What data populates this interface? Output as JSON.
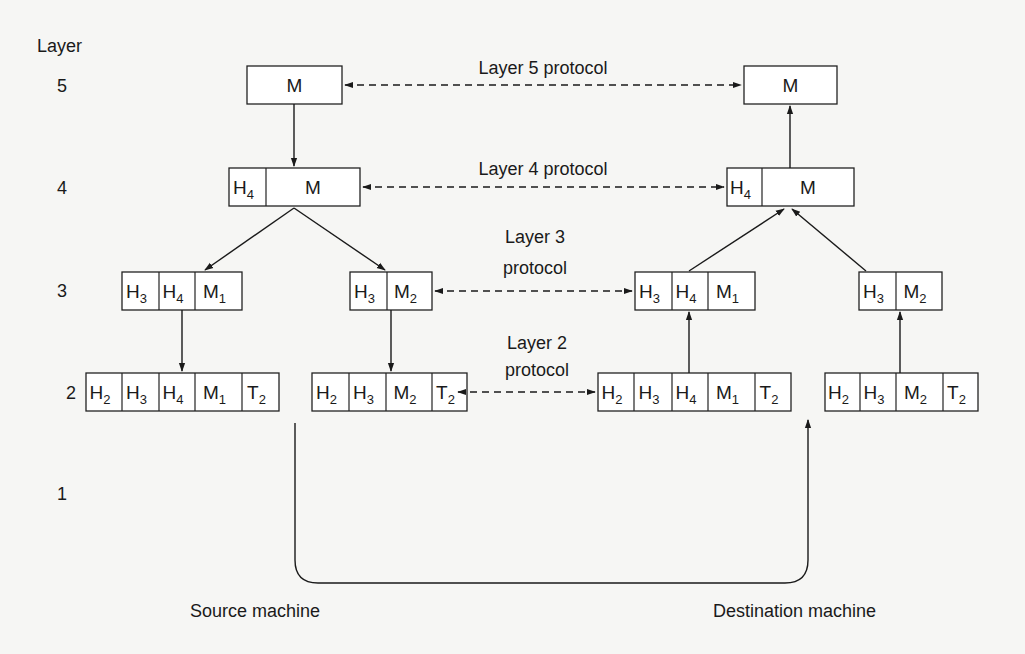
{
  "figure": {
    "layer_axis_label": "Layer",
    "layer_numbers": [
      "5",
      "4",
      "3",
      "2",
      "1"
    ],
    "source_label": "Source machine",
    "destination_label": "Destination machine"
  },
  "protocols": [
    {
      "id": "l5",
      "lines": [
        "Layer 5 protocol"
      ]
    },
    {
      "id": "l4",
      "lines": [
        "Layer 4 protocol"
      ]
    },
    {
      "id": "l3",
      "lines": [
        "Layer 3",
        "protocol"
      ]
    },
    {
      "id": "l2",
      "lines": [
        "Layer 2",
        "protocol"
      ]
    }
  ],
  "packets": {
    "src_l5": [
      {
        "t": "M",
        "s": ""
      }
    ],
    "src_l4": [
      {
        "t": "H",
        "s": "4"
      },
      {
        "t": "M",
        "s": ""
      }
    ],
    "src_l3a": [
      {
        "t": "H",
        "s": "3"
      },
      {
        "t": "H",
        "s": "4"
      },
      {
        "t": "M",
        "s": "1"
      }
    ],
    "src_l3b": [
      {
        "t": "H",
        "s": "3"
      },
      {
        "t": "M",
        "s": "2"
      }
    ],
    "src_l2a": [
      {
        "t": "H",
        "s": "2"
      },
      {
        "t": "H",
        "s": "3"
      },
      {
        "t": "H",
        "s": "4"
      },
      {
        "t": "M",
        "s": "1"
      },
      {
        "t": "T",
        "s": "2"
      }
    ],
    "src_l2b": [
      {
        "t": "H",
        "s": "2"
      },
      {
        "t": "H",
        "s": "3"
      },
      {
        "t": "M",
        "s": "2"
      },
      {
        "t": "T",
        "s": "2"
      }
    ],
    "dst_l5": [
      {
        "t": "M",
        "s": ""
      }
    ],
    "dst_l4": [
      {
        "t": "H",
        "s": "4"
      },
      {
        "t": "M",
        "s": ""
      }
    ],
    "dst_l3a": [
      {
        "t": "H",
        "s": "3"
      },
      {
        "t": "H",
        "s": "4"
      },
      {
        "t": "M",
        "s": "1"
      }
    ],
    "dst_l3b": [
      {
        "t": "H",
        "s": "3"
      },
      {
        "t": "M",
        "s": "2"
      }
    ],
    "dst_l2a": [
      {
        "t": "H",
        "s": "2"
      },
      {
        "t": "H",
        "s": "3"
      },
      {
        "t": "H",
        "s": "4"
      },
      {
        "t": "M",
        "s": "1"
      },
      {
        "t": "T",
        "s": "2"
      }
    ],
    "dst_l2b": [
      {
        "t": "H",
        "s": "2"
      },
      {
        "t": "H",
        "s": "3"
      },
      {
        "t": "M",
        "s": "2"
      },
      {
        "t": "T",
        "s": "2"
      }
    ]
  }
}
